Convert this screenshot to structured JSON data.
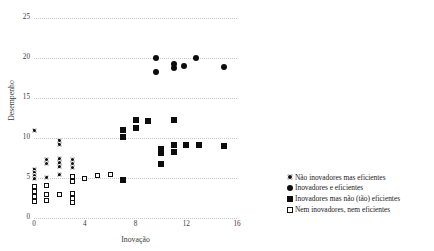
{
  "chart_data": {
    "type": "scatter",
    "title": "",
    "xlabel": "Inovação",
    "ylabel": "Desempenho",
    "xlim": [
      0,
      16
    ],
    "ylim": [
      0,
      25
    ],
    "xticks": [
      0,
      4,
      8,
      12,
      16
    ],
    "yticks": [
      0,
      5,
      10,
      15,
      20,
      25
    ],
    "grid": true,
    "grid_style": "dotted horizontal",
    "legend_position": "bottom-right",
    "series": [
      {
        "name": "Não inovadores mas eficientes",
        "marker": "circle-with-dot",
        "color": "#111111",
        "points": [
          [
            0,
            11
          ],
          [
            0,
            6.1
          ],
          [
            0,
            5.7
          ],
          [
            0,
            5.3
          ],
          [
            0,
            4.9
          ],
          [
            1,
            7.3
          ],
          [
            1,
            6.8
          ],
          [
            1,
            5.1
          ],
          [
            2,
            9.7
          ],
          [
            2,
            9.2
          ],
          [
            2,
            7.4
          ],
          [
            2,
            6.9
          ],
          [
            2,
            6.4
          ],
          [
            2,
            5.4
          ],
          [
            3,
            7.3
          ],
          [
            3,
            6.8
          ],
          [
            3,
            6.3
          ]
        ]
      },
      {
        "name": "Inovadores e eficientes",
        "marker": "filled-circle",
        "color": "#0d0d0d",
        "points": [
          [
            9.6,
            20.0
          ],
          [
            9.6,
            18.3
          ],
          [
            11.0,
            19.2
          ],
          [
            11.0,
            18.7
          ],
          [
            11.8,
            19.0
          ],
          [
            12.8,
            20.0
          ],
          [
            15.0,
            18.9
          ]
        ]
      },
      {
        "name": "Inovadores mas não (tão) eficientes",
        "marker": "filled-square",
        "color": "#0d0d0d",
        "points": [
          [
            7,
            11.0
          ],
          [
            7,
            10.1
          ],
          [
            8,
            12.3
          ],
          [
            8,
            11.3
          ],
          [
            9,
            12.1
          ],
          [
            10,
            8.6
          ],
          [
            10,
            8.1
          ],
          [
            10,
            6.8
          ],
          [
            11,
            12.2
          ],
          [
            11,
            9.1
          ],
          [
            11,
            8.3
          ],
          [
            12,
            9.1
          ],
          [
            13,
            9.1
          ],
          [
            15,
            9.0
          ],
          [
            7,
            4.8
          ]
        ]
      },
      {
        "name": "Nem inovadores, nem eficientes",
        "marker": "open-square",
        "color": "#111111",
        "points": [
          [
            0,
            3.9
          ],
          [
            0,
            3.3
          ],
          [
            0,
            2.7
          ],
          [
            0,
            2.1
          ],
          [
            1,
            4.1
          ],
          [
            1,
            2.9
          ],
          [
            1,
            2.2
          ],
          [
            2,
            3.0
          ],
          [
            3,
            5.2
          ],
          [
            3,
            4.6
          ],
          [
            3,
            3.1
          ],
          [
            3,
            2.5
          ],
          [
            3,
            1.9
          ],
          [
            4,
            5.0
          ],
          [
            5,
            5.3
          ],
          [
            6,
            5.4
          ]
        ]
      }
    ]
  },
  "legend": {
    "items": [
      {
        "label": "Não inovadores mas eficientes",
        "marker": "circle-with-dot"
      },
      {
        "label": "Inovadores e eficientes",
        "marker": "filled-circle"
      },
      {
        "label": "Inovadores mas não (tão) eficientes",
        "marker": "filled-square"
      },
      {
        "label": "Nem inovadores, nem eficientes",
        "marker": "open-square"
      }
    ]
  }
}
